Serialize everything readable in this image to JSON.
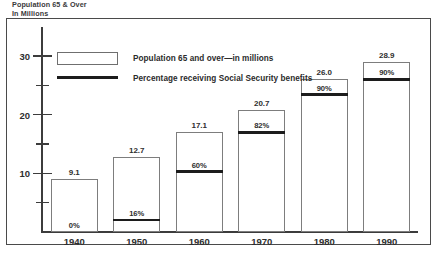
{
  "chart_data": {
    "type": "bar",
    "title": "Population 65 & Over\nIn Millions",
    "xlabel": "",
    "ylabel": "",
    "ylim": [
      0,
      33
    ],
    "grid": false,
    "legend_position": "top-left",
    "categories": [
      "1940",
      "1950",
      "1960",
      "1970",
      "1980",
      "1990"
    ],
    "series": [
      {
        "name": "Population 65 and over—in millions",
        "values": [
          9.1,
          12.7,
          17.1,
          20.7,
          26.0,
          28.9
        ]
      },
      {
        "name": "Percentage receiving Social Security benefits",
        "values": [
          0,
          16,
          60,
          82,
          90,
          90
        ]
      }
    ],
    "value_labels": [
      "9.1",
      "12.7",
      "17.1",
      "20.7",
      "26.0",
      "28.9"
    ],
    "percent_labels": [
      "0%",
      "16%",
      "60%",
      "82%",
      "90%",
      "90%"
    ],
    "y_ticks_major": [
      10,
      20,
      30
    ],
    "y_ticks_minor": [
      5,
      15,
      25
    ],
    "y_tick_labels": [
      "10",
      "20",
      "30"
    ],
    "colors": {
      "bar_fill": "#ffffff",
      "bar_outline": "#7d7d7d",
      "percent_line": "#1c1c1c",
      "axis": "#3c3c3c",
      "text": "#2e2e2e",
      "frame": "#4a4a4a"
    }
  },
  "legend": {
    "items": [
      {
        "label": "Population 65 and over—in millions",
        "marker": "box"
      },
      {
        "label": "Percentage receiving Social Security benefits",
        "marker": "line"
      }
    ]
  }
}
